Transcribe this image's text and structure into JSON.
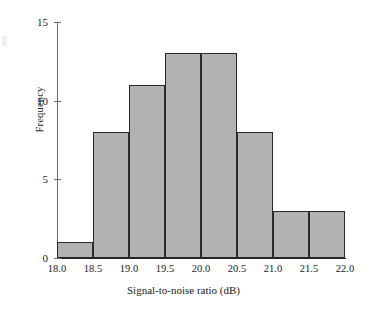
{
  "chart_data": {
    "type": "bar",
    "title": "",
    "xlabel": "Signal-to-noise ratio (dB)",
    "ylabel": "Frequency",
    "categories": [
      "18.0-18.5",
      "18.5-19.0",
      "19.0-19.5",
      "19.5-20.0",
      "20.0-20.5",
      "20.5-21.0",
      "21.0-21.5",
      "21.5-22.0"
    ],
    "bin_edges": [
      18.0,
      18.5,
      19.0,
      19.5,
      20.0,
      20.5,
      21.0,
      21.5,
      22.0
    ],
    "values": [
      1,
      8,
      11,
      13,
      13,
      8,
      3,
      3
    ],
    "xlim": [
      18.0,
      22.0
    ],
    "ylim": [
      0,
      15
    ],
    "xticks": [
      18.0,
      18.5,
      19.0,
      19.5,
      20.0,
      20.5,
      21.0,
      21.5,
      22.0
    ],
    "xtick_labels": [
      "18.0",
      "18.5",
      "19.0",
      "19.5",
      "20.0",
      "20.5",
      "21.0",
      "21.5",
      "22.0"
    ],
    "yticks": [
      0,
      5,
      10,
      15
    ],
    "ytick_labels": [
      "0",
      "5",
      "10",
      "15"
    ],
    "grid": false,
    "legend": null,
    "bar_fill_color": "#b2b2b2",
    "bar_edge_color": "#2a2a2a",
    "axis_color": "#1f1f1f",
    "background_color": "#ffffff",
    "total_count": 60
  }
}
